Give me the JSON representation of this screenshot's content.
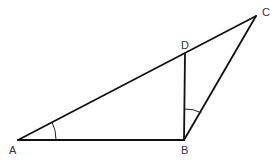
{
  "diagram": {
    "type": "geometry-triangle",
    "points": {
      "A": {
        "label": "A",
        "x": 18,
        "y": 140
      },
      "B": {
        "label": "B",
        "x": 184,
        "y": 140
      },
      "C": {
        "label": "C",
        "x": 256,
        "y": 16
      },
      "D": {
        "label": "D",
        "x": 185,
        "y": 54
      }
    },
    "segments": [
      "AB",
      "BC",
      "CA",
      "BD"
    ],
    "marked_angles": [
      "angle BAD (at A)",
      "angle DBC (at B)"
    ],
    "colors": {
      "stroke": "#111111",
      "label": "#333333",
      "background": "#ffffff"
    }
  }
}
